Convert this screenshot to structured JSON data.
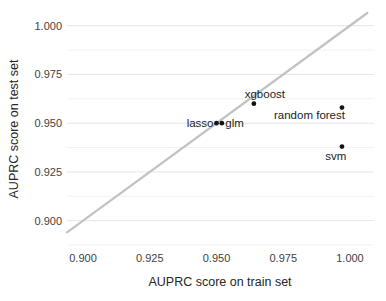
{
  "chart_data": {
    "type": "scatter",
    "title": "",
    "xlabel": "AUPRC score on train set",
    "ylabel": "AUPRC score on test set",
    "xlim": [
      0.894,
      1.009
    ],
    "ylim": [
      0.887,
      1.0065
    ],
    "xticks": [
      0.9,
      0.925,
      0.95,
      0.975,
      1.0
    ],
    "yticks": [
      0.9,
      0.925,
      0.95,
      0.975,
      1.0
    ],
    "xtick_labels": [
      "0.900",
      "0.925",
      "0.950",
      "0.975",
      "1.000"
    ],
    "ytick_labels": [
      "0.900",
      "0.925",
      "0.950",
      "0.975",
      "1.000"
    ],
    "minor_yticks": [
      0.8875,
      0.9125,
      0.9375,
      0.9625,
      0.9875
    ],
    "grid": "horizontal major and minor, no vertical",
    "legend": "none",
    "identity_line": {
      "slope": 1,
      "intercept": 0
    },
    "points": [
      {
        "label": "lasso",
        "x": 0.95,
        "y": 0.95,
        "anchor": "end",
        "dx": -3,
        "dy": 4
      },
      {
        "label": "glm",
        "x": 0.952,
        "y": 0.95,
        "anchor": "start",
        "dx": 3.5,
        "dy": 4
      },
      {
        "label": "xgboost",
        "x": 0.964,
        "y": 0.96,
        "anchor": "middle",
        "dx": 11,
        "dy": -5.5
      },
      {
        "label": "random forest",
        "x": 0.997,
        "y": 0.958,
        "anchor": "end",
        "dx": 3,
        "dy": 11
      },
      {
        "label": "svm",
        "x": 0.997,
        "y": 0.938,
        "anchor": "end",
        "dx": 4.5,
        "dy": 13
      }
    ],
    "colors": {
      "background": "#ffffff",
      "point": "#141414",
      "point_label": "#1c1c1c",
      "identity_line": "#c2c2c2",
      "grid_major": "#e6e6e6",
      "grid_minor": "#f2f2f2",
      "tick_label": "#424242",
      "axis_title": "#262626"
    }
  }
}
